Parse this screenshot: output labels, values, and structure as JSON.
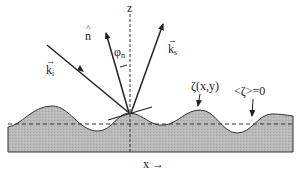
{
  "diagram": {
    "type": "rough-surface-scattering",
    "labels": {
      "z_axis": "z",
      "x_axis": "x →",
      "normal": "n",
      "normal_accent": "^",
      "angle": "φ",
      "angle_sub": "n",
      "incident": "k",
      "incident_sub": "i",
      "scattered": "k",
      "scattered_sub": "s",
      "vector_arrow": "→",
      "surface_height": "ζ(x,y)",
      "mean_plane": "<ζ>=0"
    },
    "colors": {
      "surface_fill": "#b8b8b8",
      "line": "#222222",
      "background": "#ffffff"
    }
  }
}
